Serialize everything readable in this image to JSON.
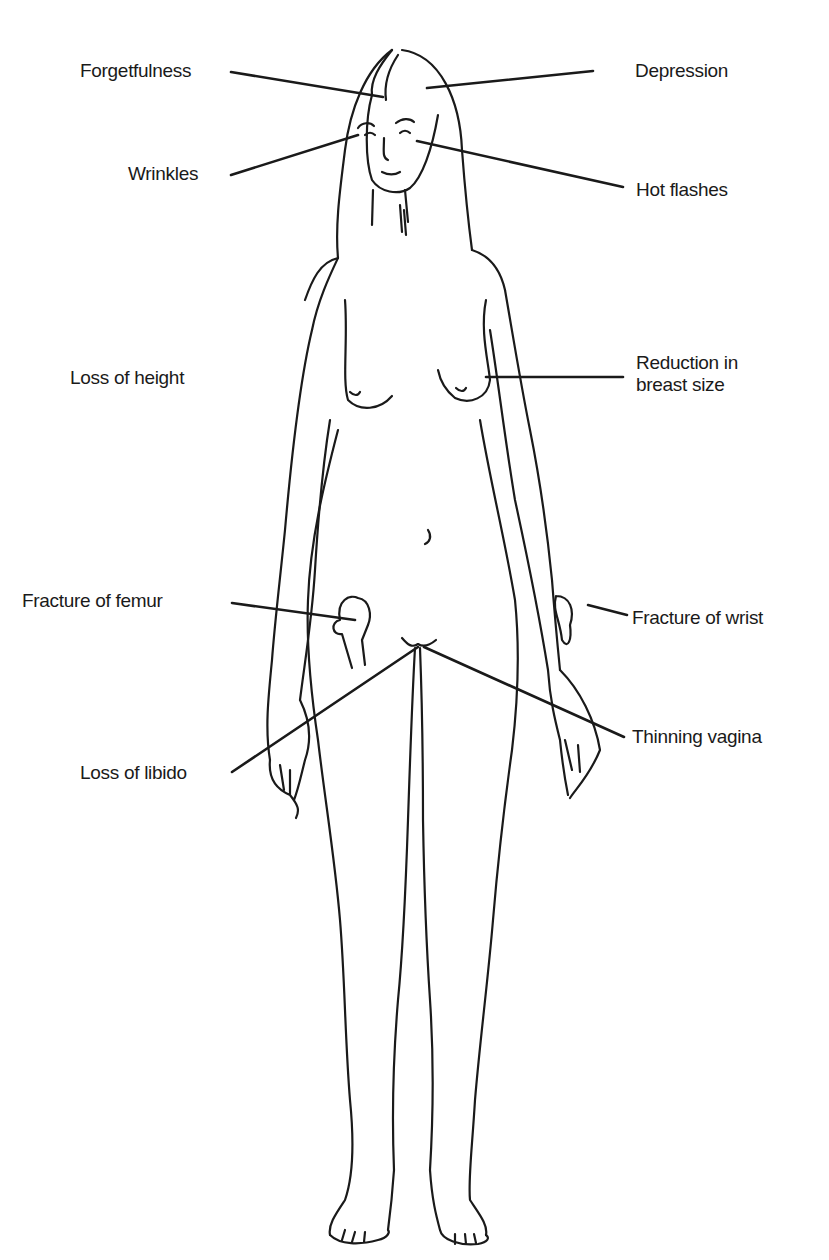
{
  "diagram": {
    "colors": {
      "ink": "#1a1a1a",
      "background": "#ffffff"
    },
    "labels": {
      "forgetfulness": "Forgetfulness",
      "wrinkles": "Wrinkles",
      "depression": "Depression",
      "hot_flashes": "Hot flashes",
      "loss_of_height": "Loss of height",
      "reduction_in_breast_size_line1": "Reduction in",
      "reduction_in_breast_size_line2": "breast size",
      "fracture_of_femur": "Fracture of femur",
      "fracture_of_wrist": "Fracture of wrist",
      "thinning_vagina": "Thinning vagina",
      "loss_of_libido": "Loss of libido"
    }
  }
}
